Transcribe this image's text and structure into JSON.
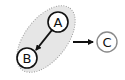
{
  "diagram": {
    "cluster": {
      "fill": "#e6e6e6",
      "border": "#9a9a9a",
      "style": "dotted",
      "members": [
        "A",
        "B"
      ]
    },
    "nodes": [
      {
        "id": "A",
        "label": "A",
        "cx": 58,
        "cy": 22,
        "border": "#111111"
      },
      {
        "id": "B",
        "label": "B",
        "cx": 27,
        "cy": 58,
        "border": "#111111"
      },
      {
        "id": "C",
        "label": "C",
        "cx": 107,
        "cy": 42,
        "border": "#8a8a8a"
      }
    ],
    "edges": [
      {
        "from": "A",
        "to": "B"
      },
      {
        "from": "cluster",
        "to": "C"
      }
    ]
  }
}
